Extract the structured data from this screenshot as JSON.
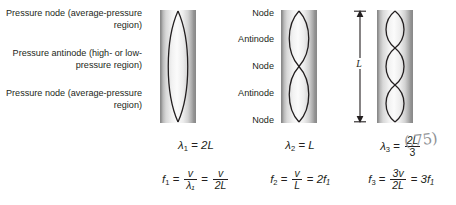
{
  "diagram": {
    "side_labels": [
      "Pressure node (average-pressure region)",
      "Pressure antinode (high- or low-pressure region)",
      "Pressure node (average-pressure region)"
    ],
    "node_labels": [
      "Node",
      "Antinode",
      "Node",
      "Antinode",
      "Node"
    ],
    "length_marker": "L",
    "handwritten_note": "(.75)",
    "colors": {
      "text": "#231f20",
      "curve": "#231f20",
      "tube_edge": "#8a8a8a",
      "tube_light": "#fbfbfb",
      "handwriting": "#8f9296",
      "background": "#ffffff"
    },
    "harmonics": [
      {
        "order": 1,
        "loops": 1,
        "wavelength_label": "λ₁ = 2L",
        "wavelength_lhs": "λ",
        "wavelength_sub": "1",
        "wavelength_rhs": "2L",
        "frequency_lhs": "f",
        "frequency_sub": "1",
        "frac1_num": "v",
        "frac1_den": "λ₁",
        "frac2_num": "v",
        "frac2_den": "2L"
      },
      {
        "order": 2,
        "loops": 2,
        "wavelength_label": "λ₂ = L",
        "wavelength_lhs": "λ",
        "wavelength_sub": "2",
        "wavelength_rhs": "L",
        "frequency_lhs": "f",
        "frequency_sub": "2",
        "frac1_num": "v",
        "frac1_den": "L",
        "result": "2f₁"
      },
      {
        "order": 3,
        "loops": 3,
        "wavelength_label": "λ₃ = 2L/3",
        "wavelength_lhs": "λ",
        "wavelength_sub": "3",
        "frac_num": "2L",
        "frac_den": "3",
        "frequency_lhs": "f",
        "frequency_sub": "3",
        "frac1_num": "3v",
        "frac1_den": "2L",
        "result": "3f₁"
      }
    ]
  }
}
